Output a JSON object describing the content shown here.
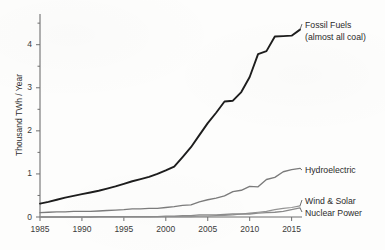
{
  "chart_data": {
    "type": "line",
    "title": "",
    "xlabel": "",
    "ylabel": "Thousand TWh / Year",
    "xlim": [
      1985,
      2016
    ],
    "ylim": [
      0,
      4.55
    ],
    "grid": false,
    "legend_position": "right-inline-labels",
    "xticks": [
      "1985",
      "1990",
      "1995",
      "2000",
      "2005",
      "2010",
      "2015"
    ],
    "xtick_values": [
      1985,
      1990,
      1995,
      2000,
      2005,
      2010,
      2015
    ],
    "yticks": [
      "0",
      "1",
      "2",
      "3",
      "4"
    ],
    "ytick_values": [
      0,
      1,
      2,
      3,
      4
    ],
    "x": [
      1985,
      1986,
      1987,
      1988,
      1989,
      1990,
      1991,
      1992,
      1993,
      1994,
      1995,
      1996,
      1997,
      1998,
      1999,
      2000,
      2001,
      2002,
      2003,
      2004,
      2005,
      2006,
      2007,
      2008,
      2009,
      2010,
      2011,
      2012,
      2013,
      2014,
      2015,
      2016
    ],
    "series": [
      {
        "name": "Fossil Fuels",
        "color": "#1d1d1d",
        "width": 1.9,
        "label_lines": [
          "Fossil Fuels",
          "(almost all coal)"
        ],
        "values": [
          0.31,
          0.35,
          0.4,
          0.45,
          0.49,
          0.53,
          0.57,
          0.61,
          0.66,
          0.71,
          0.77,
          0.83,
          0.88,
          0.93,
          1.0,
          1.08,
          1.17,
          1.39,
          1.62,
          1.9,
          2.18,
          2.42,
          2.68,
          2.7,
          2.9,
          3.25,
          3.78,
          3.85,
          4.19,
          4.2,
          4.21,
          4.35
        ]
      },
      {
        "name": "Hydroelectric",
        "color": "#7b7b7b",
        "width": 1.35,
        "label_lines": [
          "Hydroelectric"
        ],
        "values": [
          0.1,
          0.11,
          0.12,
          0.12,
          0.13,
          0.13,
          0.13,
          0.14,
          0.15,
          0.16,
          0.17,
          0.19,
          0.19,
          0.2,
          0.2,
          0.22,
          0.24,
          0.27,
          0.28,
          0.35,
          0.4,
          0.44,
          0.49,
          0.59,
          0.62,
          0.71,
          0.7,
          0.87,
          0.92,
          1.05,
          1.1,
          1.13
        ]
      },
      {
        "name": "Wind & Solar",
        "color": "#949494",
        "width": 1.2,
        "label_lines": [
          "Wind & Solar"
        ],
        "values": [
          0.0,
          0.0,
          0.0,
          0.0,
          0.0,
          0.0,
          0.0,
          0.0,
          0.0,
          0.0,
          0.0,
          0.0,
          0.0,
          0.0,
          0.01,
          0.01,
          0.01,
          0.01,
          0.01,
          0.02,
          0.02,
          0.03,
          0.04,
          0.05,
          0.07,
          0.09,
          0.11,
          0.13,
          0.17,
          0.2,
          0.22,
          0.26
        ]
      },
      {
        "name": "Nuclear Power",
        "color": "#8a8a8a",
        "width": 1.3,
        "label_lines": [
          "Nuclear Power"
        ],
        "values": [
          0.0,
          0.0,
          0.0,
          0.0,
          0.0,
          0.0,
          0.0,
          0.01,
          0.01,
          0.01,
          0.01,
          0.01,
          0.01,
          0.01,
          0.01,
          0.02,
          0.02,
          0.03,
          0.03,
          0.05,
          0.05,
          0.05,
          0.06,
          0.07,
          0.07,
          0.07,
          0.09,
          0.1,
          0.11,
          0.13,
          0.17,
          0.21
        ]
      }
    ],
    "annotations": [
      {
        "text": "Fossil Fuels",
        "series": "Fossil Fuels"
      },
      {
        "text": "(almost all coal)",
        "series": "Fossil Fuels"
      },
      {
        "text": "Hydroelectric",
        "series": "Hydroelectric"
      },
      {
        "text": "Wind & Solar",
        "series": "Wind & Solar"
      },
      {
        "text": "Nuclear Power",
        "series": "Nuclear Power"
      }
    ]
  },
  "labels": {
    "fossil_line1": "Fossil Fuels",
    "fossil_line2": "(almost all coal)",
    "hydro": "Hydroelectric",
    "wind_solar": "Wind & Solar",
    "nuclear": "Nuclear Power",
    "y_axis_title": "Thousand TWh / Year"
  }
}
